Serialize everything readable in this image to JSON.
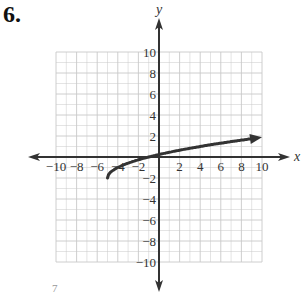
{
  "problem": {
    "number": "6."
  },
  "footer_fragment": "7",
  "chart_data": {
    "type": "line",
    "title": "",
    "xlabel": "x",
    "ylabel": "y",
    "xlim": [
      -10,
      10
    ],
    "ylim": [
      -10,
      10
    ],
    "grid": true,
    "grid_step": 2,
    "x_ticks": [
      -10,
      -8,
      -6,
      -4,
      -2,
      2,
      4,
      6,
      8,
      10
    ],
    "y_ticks": [
      -10,
      -8,
      -6,
      -4,
      -2,
      2,
      4,
      6,
      8,
      10
    ],
    "x_tick_labels": [
      "−10",
      "−8",
      "−6",
      "−4",
      "−2",
      "2",
      "4",
      "6",
      "8",
      "10"
    ],
    "y_tick_labels": [
      "10",
      "8",
      "6",
      "4",
      "2",
      "−2",
      "−4",
      "−6",
      "−8",
      "−10"
    ],
    "series": [
      {
        "name": "curve",
        "description": "square-root curve starting at (-5,-2) with arrow toward x=10",
        "start_point": [
          -5,
          -2
        ],
        "end_arrow": true,
        "x": [
          -5,
          -4.5,
          -4,
          -3,
          -1,
          1,
          4,
          7,
          10
        ],
        "y": [
          -2,
          -1.29,
          -1,
          -0.59,
          0,
          0.45,
          1,
          1.46,
          1.87
        ]
      }
    ],
    "colors": {
      "axis": "#333333",
      "grid": "#c8c8c8",
      "curve": "#333333"
    }
  }
}
